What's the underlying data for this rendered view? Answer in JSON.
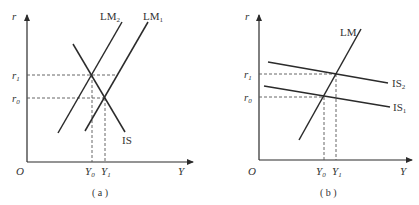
{
  "panels": [
    {
      "id": "a",
      "caption": "( a )",
      "axes": {
        "y_label": "r",
        "x_label": "Y",
        "origin_label": "O"
      },
      "ticks": {
        "r1": {
          "base": "r",
          "sub": "1"
        },
        "r0": {
          "base": "r",
          "sub": "0"
        },
        "Y0": {
          "base": "Y",
          "sub": "0"
        },
        "Y1": {
          "base": "Y",
          "sub": "1"
        }
      },
      "curves": {
        "lm_left": {
          "base": "LM",
          "sub": "2"
        },
        "lm_right": {
          "base": "LM",
          "sub": "1"
        },
        "is": {
          "base": "IS",
          "sub": ""
        }
      }
    },
    {
      "id": "b",
      "caption": "( b )",
      "axes": {
        "y_label": "r",
        "x_label": "Y",
        "origin_label": "O"
      },
      "ticks": {
        "r1": {
          "base": "r",
          "sub": "1"
        },
        "r0": {
          "base": "r",
          "sub": "0"
        },
        "Y0": {
          "base": "Y",
          "sub": "0"
        },
        "Y1": {
          "base": "Y",
          "sub": "1"
        }
      },
      "curves": {
        "lm": {
          "base": "LM",
          "sub": ""
        },
        "is2": {
          "base": "IS",
          "sub": "2"
        },
        "is1": {
          "base": "IS",
          "sub": "1"
        }
      }
    }
  ],
  "colors": {
    "line": "#2b2b2b",
    "dash": "#555555",
    "text": "#333333",
    "background": "#ffffff"
  }
}
